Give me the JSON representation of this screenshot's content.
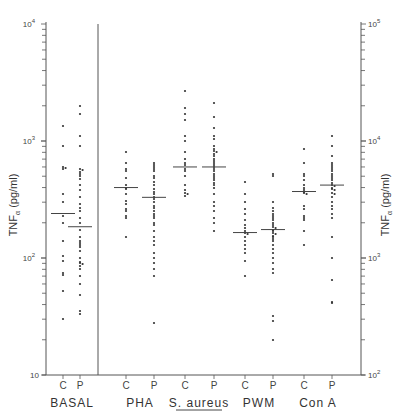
{
  "chart_data": {
    "type": "scatter",
    "subtype": "dot-plot with median bars, log scale",
    "title": "",
    "ylabel_left": "TNFα (pg/ml)",
    "ylabel_right": "TNFα (pg/ml)",
    "yscale": "log",
    "ylim_left": [
      10,
      10000
    ],
    "ylim_right": [
      100,
      100000
    ],
    "left_tick_labels": [
      "10",
      "10²",
      "10³",
      "10⁴"
    ],
    "right_tick_labels": [
      "10²",
      "10³",
      "10⁴",
      "10⁵"
    ],
    "grid": false,
    "legend": null,
    "groups": [
      {
        "name": "BASAL",
        "axis": "left",
        "underline": false,
        "series": [
          {
            "name": "C",
            "median": 240,
            "values": [
              1350,
              900,
              600,
              580,
              590,
              350,
              300,
              230,
              200,
              140,
              105,
              95,
              75,
              72,
              52,
              30
            ]
          },
          {
            "name": "P",
            "median": 185,
            "values": [
              2000,
              1700,
              1100,
              900,
              580,
              560,
              540,
              520,
              500,
              470,
              420,
              380,
              330,
              290,
              270,
              250,
              220,
              200,
              175,
              150,
              140,
              135,
              130,
              125,
              115,
              100,
              92,
              90,
              88,
              85,
              80,
              70,
              60,
              48,
              35,
              33
            ]
          }
        ]
      },
      {
        "name": "PHA",
        "axis": "right",
        "underline": false,
        "series": [
          {
            "name": "C",
            "median": 4000,
            "values": [
              8000,
              6500,
              5800,
              5500,
              4800,
              4200,
              4000,
              3900,
              3500,
              3100,
              2900,
              2600,
              2500,
              2300,
              2200,
              1500
            ]
          },
          {
            "name": "P",
            "median": 3300,
            "values": [
              6500,
              6200,
              6000,
              5800,
              5500,
              5000,
              4800,
              4500,
              4200,
              3900,
              3700,
              3500,
              3300,
              3200,
              3000,
              2800,
              2700,
              2500,
              2400,
              2300,
              2200,
              2000,
              1900,
              1700,
              1500,
              1400,
              1300,
              1100,
              1000,
              900,
              800,
              700,
              280
            ]
          }
        ]
      },
      {
        "name": "S. aureus",
        "axis": "right",
        "underline": true,
        "series": [
          {
            "name": "C",
            "median": 6000,
            "values": [
              27000,
              19000,
              17000,
              15000,
              11000,
              10000,
              8000,
              7000,
              6500,
              6200,
              5800,
              5500,
              5000,
              4200,
              3800,
              3600,
              3500,
              3400
            ]
          },
          {
            "name": "P",
            "median": 6000,
            "values": [
              21000,
              16000,
              13000,
              11000,
              10500,
              9000,
              8500,
              8200,
              8000,
              7800,
              7500,
              7000,
              6800,
              6500,
              6200,
              6000,
              5800,
              5500,
              5200,
              5000,
              4800,
              4600,
              4400,
              4200,
              4000,
              3500,
              3000,
              2800,
              2500,
              2200,
              2000,
              1700
            ]
          }
        ]
      },
      {
        "name": "PWM",
        "axis": "right",
        "underline": false,
        "series": [
          {
            "name": "C",
            "median": 1650,
            "values": [
              4500,
              3500,
              3000,
              2600,
              2400,
              2100,
              1900,
              1800,
              1700,
              1650,
              1600,
              1500,
              1400,
              1300,
              1200,
              1100,
              950,
              700
            ]
          },
          {
            "name": "P",
            "median": 1750,
            "values": [
              5200,
              5000,
              3000,
              2700,
              2500,
              2400,
              2300,
              2200,
              2100,
              2000,
              1900,
              1850,
              1800,
              1750,
              1700,
              1650,
              1600,
              1550,
              1500,
              1450,
              1400,
              1300,
              1200,
              1100,
              1000,
              900,
              800,
              750,
              320,
              290,
              200
            ]
          }
        ]
      },
      {
        "name": "Con A",
        "axis": "right",
        "underline": false,
        "series": [
          {
            "name": "C",
            "median": 3700,
            "values": [
              8500,
              6500,
              5200,
              5000,
              4600,
              4200,
              4000,
              3800,
              3700,
              3600,
              3500,
              2800,
              2600,
              2300,
              2200,
              2100,
              1700,
              1300
            ]
          },
          {
            "name": "P",
            "median": 4200,
            "values": [
              11000,
              9000,
              7500,
              6500,
              6200,
              6000,
              5800,
              5500,
              5200,
              5000,
              4800,
              4600,
              4400,
              4200,
              4100,
              4000,
              3900,
              3800,
              3600,
              3500,
              3300,
              3000,
              2800,
              2600,
              2400,
              2200,
              1500,
              1000,
              650,
              420,
              410
            ]
          }
        ]
      }
    ]
  },
  "labels": {
    "y_left": "TNF",
    "y_left_sub": "α",
    "y_left_unit": " (pg/ml)",
    "y_right": "TNF",
    "y_right_sub": "α",
    "y_right_unit": " (pg/ml)",
    "left_ticks": [
      {
        "base": "10",
        "exp": "",
        "value": 10
      },
      {
        "base": "10",
        "exp": "2",
        "value": 100
      },
      {
        "base": "10",
        "exp": "3",
        "value": 1000
      },
      {
        "base": "10",
        "exp": "4",
        "value": 10000
      }
    ],
    "right_ticks": [
      {
        "base": "10",
        "exp": "2",
        "value": 100
      },
      {
        "base": "10",
        "exp": "3",
        "value": 1000
      },
      {
        "base": "10",
        "exp": "4",
        "value": 10000
      },
      {
        "base": "10",
        "exp": "5",
        "value": 100000
      }
    ]
  },
  "colors": {
    "axis": "#555555",
    "dot": "#333333",
    "median": "#444444",
    "text": "#333333"
  }
}
